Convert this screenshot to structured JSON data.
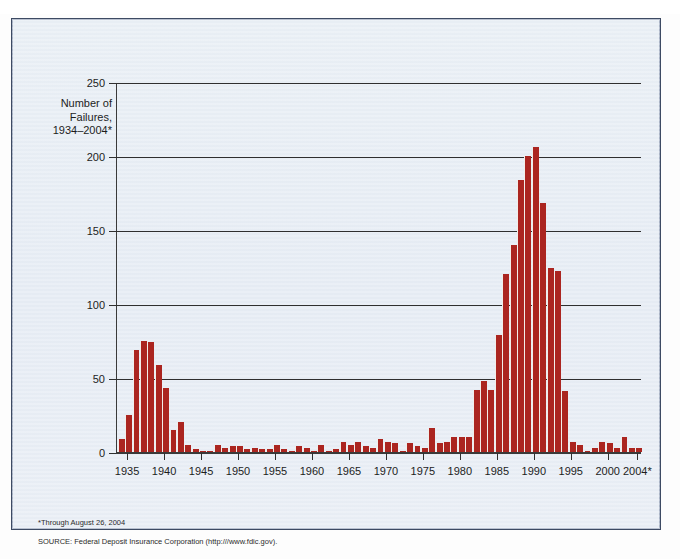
{
  "top_caption": "",
  "axis_title": {
    "line1": "Number of",
    "line2": "Failures,",
    "line3": "1934–2004*"
  },
  "footnote": {
    "line1": "*Through August 26, 2004",
    "line2": "SOURCE: Federal Deposit Insurance Corporation (http:///www.fdic.gov)."
  },
  "colors": {
    "bar": "#ab2520",
    "panel": "#e7edf4",
    "frame": "#3d4a63",
    "axis": "#2f2f2f"
  },
  "chart_data": {
    "type": "bar",
    "title": "",
    "subtitle": "",
    "xlabel": "",
    "ylabel": "Number of Failures, 1934–2004*",
    "ylim": [
      0,
      250
    ],
    "yticks": [
      0,
      50,
      100,
      150,
      200,
      250
    ],
    "xticks": [
      "1935",
      "1940",
      "1945",
      "1950",
      "1955",
      "1960",
      "1965",
      "1970",
      "1975",
      "1980",
      "1985",
      "1990",
      "1995",
      "2000",
      "2004*"
    ],
    "xtick_years": [
      1935,
      1940,
      1945,
      1950,
      1955,
      1960,
      1965,
      1970,
      1975,
      1980,
      1985,
      1990,
      1995,
      2000,
      2004
    ],
    "grid": "horizontal",
    "legend": "none",
    "xlim": [
      1934,
      2004
    ],
    "categories": [
      1934,
      1935,
      1936,
      1937,
      1938,
      1939,
      1940,
      1941,
      1942,
      1943,
      1944,
      1945,
      1946,
      1947,
      1948,
      1949,
      1950,
      1951,
      1952,
      1953,
      1954,
      1955,
      1956,
      1957,
      1958,
      1959,
      1960,
      1961,
      1962,
      1963,
      1964,
      1965,
      1966,
      1967,
      1968,
      1969,
      1970,
      1971,
      1972,
      1973,
      1974,
      1975,
      1976,
      1977,
      1978,
      1979,
      1980,
      1981,
      1982,
      1983,
      1984,
      1985,
      1986,
      1987,
      1988,
      1989,
      1990,
      1991,
      1992,
      1993,
      1994,
      1995,
      1996,
      1997,
      1998,
      1999,
      2000,
      2001,
      2002,
      2003,
      2004
    ],
    "values": [
      9,
      25,
      69,
      75,
      74,
      59,
      43,
      15,
      20,
      5,
      2,
      1,
      1,
      5,
      3,
      4,
      4,
      2,
      3,
      2,
      2,
      5,
      2,
      1,
      4,
      3,
      1,
      5,
      1,
      2,
      7,
      5,
      7,
      4,
      3,
      9,
      7,
      6,
      1,
      6,
      4,
      3,
      16,
      6,
      7,
      10,
      10,
      10,
      42,
      48,
      42,
      79,
      120,
      140,
      184,
      200,
      206,
      168,
      124,
      122,
      41,
      7,
      5,
      1,
      3,
      7,
      6,
      3,
      10,
      3,
      3
    ]
  }
}
